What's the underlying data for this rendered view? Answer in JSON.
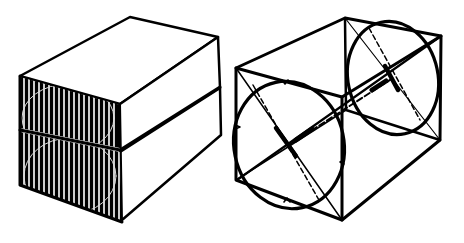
{
  "figure": {
    "colors": {
      "background": "#ffffff",
      "ink": "#000000"
    },
    "left_figure": {
      "name": "stacked-blocks",
      "blocks": 2,
      "hatched_face": "front-left end faces"
    },
    "right_figure": {
      "name": "wireframe-box-with-inscribed-circles",
      "circles": 2,
      "axis": "dashed centre line through both circle centres",
      "tick_marks": [
        "top",
        "left",
        "right",
        "bottom"
      ]
    }
  }
}
